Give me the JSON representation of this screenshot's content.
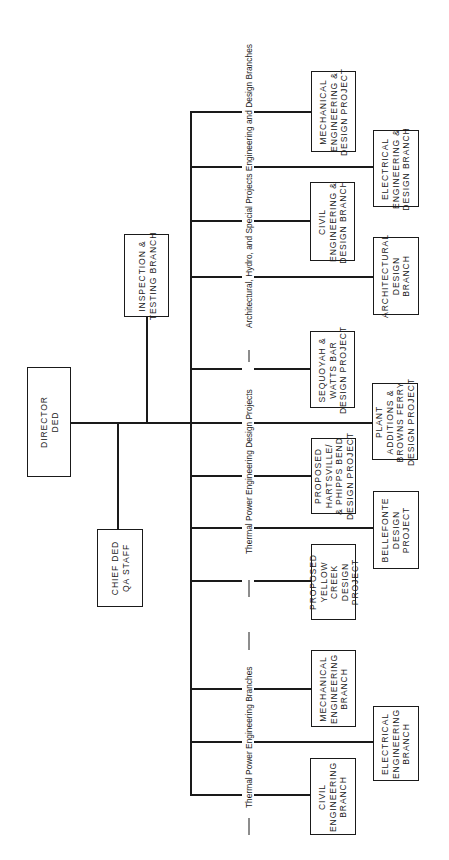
{
  "chart_title": "",
  "colors": {
    "line": "#1a1a1a",
    "background": "#ffffff"
  },
  "director": {
    "label": "DIRECTOR\nDED"
  },
  "staff": [
    {
      "label": "CHIEF DED\nQA STAFF"
    },
    {
      "label": "INSPECTION &\nTESTING BRANCH"
    }
  ],
  "groups": [
    {
      "label": "Architectural, Hydro, and Special Projects Engineering and Design Branches",
      "units": [
        {
          "label": "MECHANICAL\nENGINEERING &\nDESIGN PROJECT"
        },
        {
          "label": "ELECTRICAL\nENGINEERING &\nDESIGN BRANCH"
        },
        {
          "label": "CIVIL\nENGINEERING &\nDESIGN BRANCH"
        },
        {
          "label": "ARCHITECTURAL\nDESIGN\nBRANCH"
        }
      ]
    },
    {
      "label": "Thermal Power Engineering Design Projects",
      "units": [
        {
          "label": "SEQUOYAH &\nWATTS BAR\nDESIGN PROJECT"
        },
        {
          "label": "PLANT\nADDITIONS &\nBROWNS FERRY\nDESIGN PROJECT"
        },
        {
          "label": "PROPOSED\nHARTSVILLE/\n& PHIPPS BEND\nDESIGN PROJECT"
        },
        {
          "label": "BELLEFONTE\nDESIGN\nPROJECT"
        },
        {
          "label": "PROPOSED\nYELLOW\nCREEK\nDESIGN\nPROJECT"
        }
      ]
    },
    {
      "label": "Thermal Power Engineering Branches",
      "units": [
        {
          "label": "MECHANICAL\nENGINEERING\nBRANCH"
        },
        {
          "label": "ELECTRICAL\nENGINEERING\nBRANCH"
        },
        {
          "label": "CIVIL\nENGINEERING\nBRANCH"
        }
      ]
    }
  ]
}
